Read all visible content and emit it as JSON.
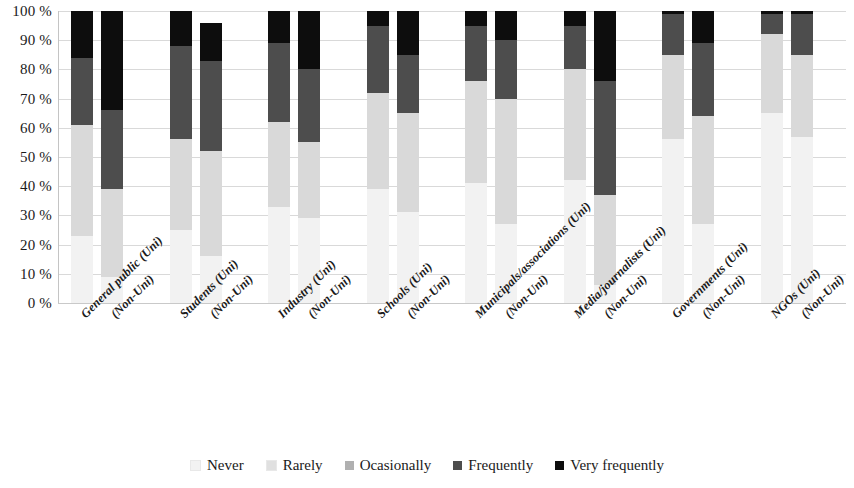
{
  "chart_data": {
    "type": "bar",
    "subtype": "stacked-percentage",
    "title": "",
    "xlabel": "",
    "ylabel": "",
    "ylim": [
      0,
      100
    ],
    "ytick_labels": [
      "0 %",
      "10 %",
      "20 %",
      "30 %",
      "40 %",
      "50 %",
      "60 %",
      "70 %",
      "80 %",
      "90 %",
      "100 %"
    ],
    "ytick_values": [
      0,
      10,
      20,
      30,
      40,
      50,
      60,
      70,
      80,
      90,
      100
    ],
    "grid": true,
    "grid_axis": "y",
    "legend_position": "bottom",
    "categories": [
      "General public (Uni)",
      "General public (Non-Uni)",
      "Students (Uni)",
      "Students (Non-Uni)",
      "Industry (Uni)",
      "Industry (Non-Uni)",
      "Schools (Uni)",
      "Schools (Non-Uni)",
      "Municipals/associations (Uni)",
      "Municipals/associations (Non-Uni)",
      "Media/journalists (Uni)",
      "Media/journalists (Non-Uni)",
      "Governments (Uni)",
      "Governments (Non-Uni)",
      "NGOs (Uni)",
      "NGOs (Non-Uni)"
    ],
    "tick_labels": [
      "General public (Uni)",
      "(Non-Uni)",
      "Students (Uni)",
      "(Non-Uni)",
      "Industry (Uni)",
      "(Non-Uni)",
      "Schools (Uni)",
      "(Non-Uni)",
      "Municipals/associations (Uni)",
      "(Non-Uni)",
      "Media/journalists (Uni)",
      "(Non-Uni)",
      "Governments (Uni)",
      "(Non-Uni)",
      "NGOs (Uni)",
      "(Non-Uni)"
    ],
    "series": [
      {
        "name": "Never",
        "color": "#f2f2f2",
        "values": [
          23,
          9,
          25,
          16,
          33,
          29,
          39,
          31,
          41,
          27,
          42,
          6,
          56,
          27,
          65,
          57
        ]
      },
      {
        "name": "Rarely",
        "color": "#d9d9d9",
        "values": [
          38,
          30,
          31,
          36,
          29,
          26,
          33,
          34,
          35,
          43,
          38,
          31,
          29,
          37,
          27,
          28
        ]
      },
      {
        "name": "Ocasionally",
        "color": "#a6a6a6",
        "values": [
          0,
          0,
          0,
          0,
          0,
          0,
          0,
          0,
          0,
          0,
          0,
          0,
          0,
          0,
          0,
          0
        ]
      },
      {
        "name": "Frequently",
        "color": "#4d4d4d",
        "values": [
          23,
          27,
          32,
          31,
          27,
          25,
          23,
          20,
          19,
          20,
          15,
          39,
          14,
          25,
          7,
          14
        ]
      },
      {
        "name": "Very frequently",
        "color": "#0d0d0d",
        "values": [
          16,
          34,
          12,
          13,
          11,
          20,
          5,
          15,
          5,
          10,
          5,
          24,
          1,
          11,
          1,
          1
        ]
      }
    ],
    "legend": [
      {
        "label": "Never",
        "color": "#f2f2f2"
      },
      {
        "label": "Rarely",
        "color": "#e0e0e0"
      },
      {
        "label": "Ocasionally",
        "color": "#b0b0b0"
      },
      {
        "label": "Frequently",
        "color": "#4d4d4d"
      },
      {
        "label": "Very frequently",
        "color": "#0d0d0d"
      }
    ]
  },
  "colors": {
    "never": "#f2f2f2",
    "rarely": "#dcdcdc",
    "ocasionally": "#b3b3b3",
    "frequently": "#4d4d4d",
    "very_frequently": "#111111",
    "gridline": "#d9d9d9",
    "text": "#1a1a1a",
    "background": "#ffffff"
  }
}
